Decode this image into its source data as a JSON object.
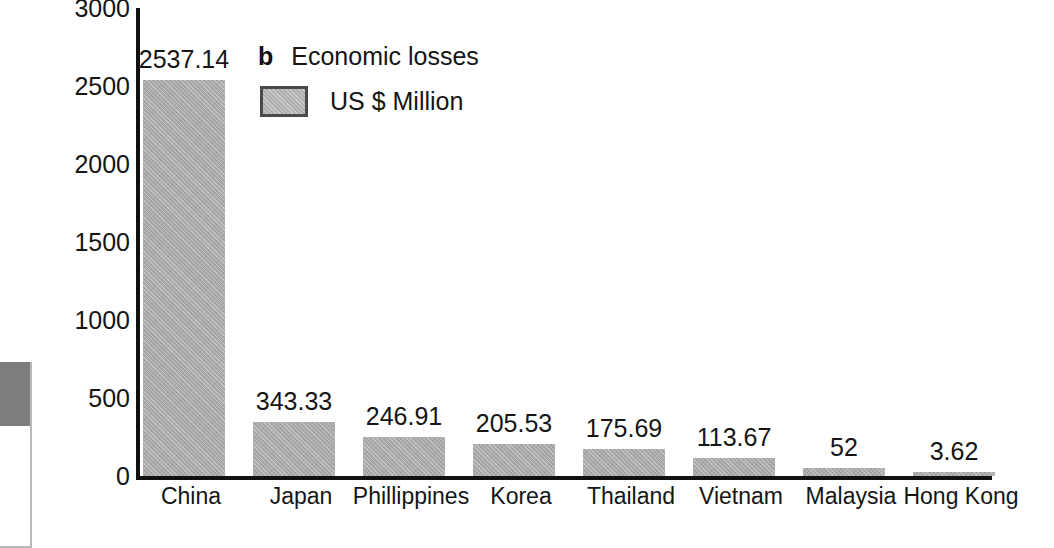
{
  "chart_data": {
    "type": "bar",
    "title": "Economic losses",
    "panel_letter": "b",
    "xlabel": "",
    "ylabel": "",
    "ylim": [
      0,
      3000
    ],
    "yticks": [
      3000,
      2500,
      2000,
      1500,
      1000,
      500,
      0
    ],
    "ytick_labels": [
      "3000",
      "2500",
      "2000",
      "1500",
      "1000",
      "500",
      "0"
    ],
    "grid": false,
    "legend_position": "top-left-inside",
    "legend": [
      {
        "name": "US $ Million",
        "color": "#a9a9a9"
      }
    ],
    "categories": [
      "China",
      "Japan",
      "Phillippines",
      "Korea",
      "Thailand",
      "Vietnam",
      "Malaysia",
      "Hong Kong"
    ],
    "values": [
      2537.14,
      343.33,
      246.91,
      205.53,
      175.69,
      113.67,
      52,
      3.62
    ],
    "value_labels": [
      "2537.14",
      "343.33",
      "246.91",
      "205.53",
      "175.69",
      "113.67",
      "52",
      "3.62"
    ],
    "series": [
      {
        "name": "US $ Million",
        "values": [
          2537.14,
          343.33,
          246.91,
          205.53,
          175.69,
          113.67,
          52,
          3.62
        ]
      }
    ]
  },
  "colors": {
    "bar_fill": "#a9a9a9",
    "axis": "#111111",
    "text": "#151515",
    "background": "#ffffff",
    "fragment_gray": "#7d7d7d"
  }
}
